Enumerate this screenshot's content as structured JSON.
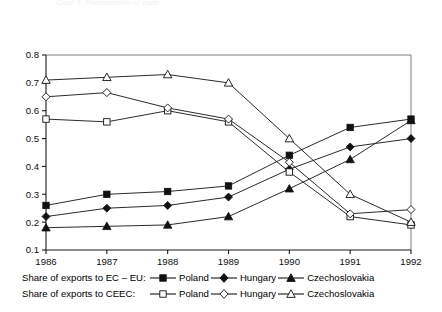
{
  "topstrip": {
    "text": "Chart 3. Reorientation of trade"
  },
  "chart_data": {
    "type": "line",
    "title": "",
    "subtitle": "",
    "xlabel": "",
    "ylabel": "",
    "x": [
      1986,
      1987,
      1988,
      1989,
      1990,
      1991,
      1992
    ],
    "categories": [
      "1986",
      "1987",
      "1988",
      "1989",
      "1990",
      "1991",
      "1992"
    ],
    "xtick_labels": [
      "1986",
      "1987",
      "1988",
      "1989",
      "1990",
      "1991",
      "1992"
    ],
    "ytick_labels": [
      "0.1",
      "0.2",
      "0.3",
      "0.4",
      "0.5",
      "0.6",
      "0.7",
      "0.8"
    ],
    "ytick_values": [
      0.1,
      0.2,
      0.3,
      0.4,
      0.5,
      0.6,
      0.7,
      0.8
    ],
    "ylim": [
      0.1,
      0.8
    ],
    "xlim": [
      1986,
      1992
    ],
    "grid": false,
    "legend_position": "bottom",
    "series": [
      {
        "name": "Poland",
        "group": "Share of exports to EC – EU:",
        "marker": "filled-square",
        "values": [
          0.26,
          0.3,
          0.31,
          0.33,
          0.44,
          0.54,
          0.57
        ]
      },
      {
        "name": "Hungary",
        "group": "Share of exports to EC – EU:",
        "marker": "filled-diamond",
        "values": [
          0.22,
          0.25,
          0.26,
          0.29,
          0.39,
          0.47,
          0.5
        ]
      },
      {
        "name": "Czechoslovakia",
        "group": "Share of exports to EC – EU:",
        "marker": "filled-triangle",
        "values": [
          0.18,
          0.185,
          0.19,
          0.22,
          0.32,
          0.425,
          0.565
        ]
      },
      {
        "name": "Poland",
        "group": "Share of exports to CEEC:",
        "marker": "open-square",
        "values": [
          0.57,
          0.56,
          0.6,
          0.56,
          0.38,
          0.22,
          0.19
        ]
      },
      {
        "name": "Hungary",
        "group": "Share of exports to CEEC:",
        "marker": "open-diamond",
        "values": [
          0.65,
          0.665,
          0.61,
          0.57,
          0.415,
          0.23,
          0.245
        ]
      },
      {
        "name": "Czechoslovakia",
        "group": "Share of exports to CEEC:",
        "marker": "open-triangle",
        "values": [
          0.71,
          0.72,
          0.73,
          0.7,
          0.5,
          0.3,
          0.2
        ]
      }
    ]
  },
  "legend": {
    "row1": {
      "title": "Share of exports to EC – EU:",
      "entries": [
        {
          "label": "Poland",
          "marker": "filled-square"
        },
        {
          "label": "Hungary",
          "marker": "filled-diamond"
        },
        {
          "label": "Czechoslovakia",
          "marker": "filled-triangle"
        }
      ]
    },
    "row2": {
      "title": "Share of exports to CEEC:",
      "entries": [
        {
          "label": "Poland",
          "marker": "open-square"
        },
        {
          "label": "Hungary",
          "marker": "open-diamond"
        },
        {
          "label": "Czechoslovakia",
          "marker": "open-triangle"
        }
      ]
    }
  },
  "colors": {
    "line": "#2b2b2b",
    "marker": "#111111",
    "axis": "#1a1a1a",
    "frame": "#6f6f6f",
    "background": "#ffffff"
  }
}
